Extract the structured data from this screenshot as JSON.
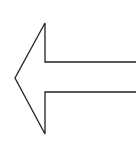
{
  "icon": {
    "name": "left-arrow",
    "style": "outline",
    "stroke_color": "#222222",
    "fill_color": "#ffffff",
    "background": "#ffffff"
  }
}
